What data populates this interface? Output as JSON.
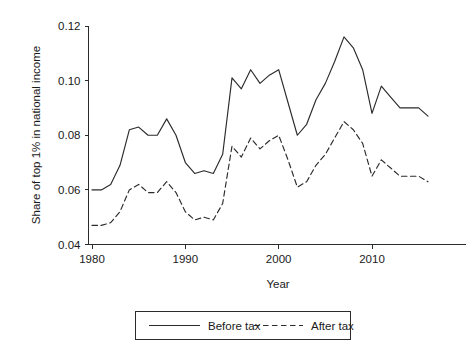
{
  "chart_data": {
    "type": "line",
    "title": "",
    "xlabel": "Year",
    "ylabel": "Share of top 1% in national income",
    "xlim": [
      1979,
      2017
    ],
    "ylim": [
      0.04,
      0.12
    ],
    "grid": false,
    "legend_position": "bottom",
    "xticks": [
      1980,
      1990,
      2000,
      2010
    ],
    "xticklabels": [
      "1980",
      "1990",
      "2000",
      "2010"
    ],
    "yticks": [
      0.04,
      0.06,
      0.08,
      0.1,
      0.12
    ],
    "yticklabels": [
      "0.04",
      "0.06",
      "0.08",
      "0.10",
      "0.12"
    ],
    "x": [
      1980,
      1981,
      1982,
      1983,
      1984,
      1985,
      1986,
      1987,
      1988,
      1989,
      1990,
      1991,
      1992,
      1993,
      1994,
      1995,
      1996,
      1997,
      1998,
      1999,
      2000,
      2001,
      2002,
      2003,
      2004,
      2005,
      2006,
      2007,
      2008,
      2009,
      2010,
      2011,
      2012,
      2013,
      2014,
      2015,
      2016
    ],
    "series": [
      {
        "name": "Before tax",
        "style": "solid",
        "values": [
          0.06,
          0.06,
          0.062,
          0.069,
          0.082,
          0.083,
          0.08,
          0.08,
          0.086,
          0.08,
          0.07,
          0.066,
          0.067,
          0.066,
          0.073,
          0.101,
          0.097,
          0.104,
          0.099,
          0.102,
          0.104,
          0.092,
          0.08,
          0.084,
          0.093,
          0.099,
          0.107,
          0.116,
          0.112,
          0.104,
          0.088,
          0.098,
          0.094,
          0.09,
          0.09,
          0.09,
          0.087
        ]
      },
      {
        "name": "After tax",
        "style": "dashed",
        "values": [
          0.047,
          0.047,
          0.048,
          0.052,
          0.06,
          0.062,
          0.059,
          0.059,
          0.063,
          0.059,
          0.052,
          0.049,
          0.05,
          0.049,
          0.055,
          0.076,
          0.072,
          0.079,
          0.075,
          0.078,
          0.08,
          0.071,
          0.061,
          0.063,
          0.069,
          0.073,
          0.079,
          0.085,
          0.082,
          0.077,
          0.065,
          0.071,
          0.068,
          0.065,
          0.065,
          0.065,
          0.063
        ]
      }
    ]
  },
  "legend": {
    "items": [
      {
        "label": "Before tax",
        "style": "solid"
      },
      {
        "label": "After tax",
        "style": "dashed"
      }
    ]
  },
  "colors": {
    "line": "#2b2b2b",
    "background": "#ffffff",
    "text": "#1a1a1a"
  }
}
